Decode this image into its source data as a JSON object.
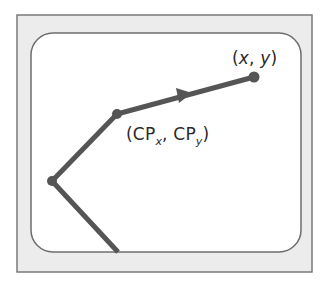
{
  "diagram": {
    "colors": {
      "frame_fill": "#ececec",
      "frame_stroke": "#7a7a7a",
      "screen_fill": "#ffffff",
      "screen_stroke": "#6e6e6e",
      "path": "#555555"
    },
    "points": {
      "endpoint": {
        "x": 254,
        "y": 77
      },
      "current_point": {
        "x": 117,
        "y": 114
      },
      "previous_vertex": {
        "x": 52,
        "y": 181
      },
      "path_start": {
        "x": 118,
        "y": 252
      }
    },
    "labels": {
      "endpoint": {
        "open": "(",
        "x": "x",
        "sep": ", ",
        "y": "y",
        "close": ")"
      },
      "current_point": {
        "open": "(",
        "cp1": "CP",
        "sub1": "x",
        "sep": ", ",
        "cp2": "CP",
        "sub2": "y",
        "close": ")"
      }
    },
    "arrow": {
      "direction": "toward-endpoint"
    }
  }
}
